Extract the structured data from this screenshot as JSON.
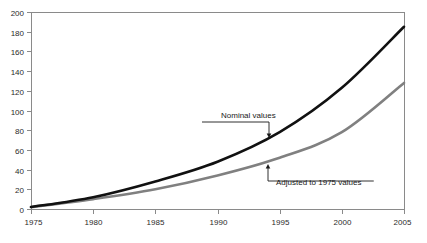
{
  "chart_data": {
    "type": "line",
    "title": "",
    "subtitle": "",
    "xlabel": "",
    "ylabel": "",
    "x": [
      1975,
      1980,
      1985,
      1990,
      1995,
      2000,
      2005
    ],
    "xlim": [
      1975,
      2005
    ],
    "ylim": [
      0,
      200
    ],
    "x_ticks": [
      "1975",
      "1980",
      "1985",
      "1990",
      "1995",
      "2000",
      "2005"
    ],
    "y_ticks": [
      "0",
      "20",
      "40",
      "60",
      "80",
      "100",
      "120",
      "140",
      "160",
      "180",
      "200"
    ],
    "grid": false,
    "legend_position": "none",
    "series": [
      {
        "name": "Nominal values",
        "color": "#111111",
        "width": 2.6,
        "values": [
          2,
          12,
          28,
          48,
          78,
          123,
          185
        ]
      },
      {
        "name": "Adjusted to 1975 values",
        "color": "#808080",
        "width": 2.6,
        "values": [
          2,
          10,
          20,
          34,
          52,
          78,
          128
        ]
      }
    ],
    "annotations": [
      {
        "text": "Nominal values",
        "text_x": 221,
        "text_y": 118,
        "target_x": 269,
        "target_y": 138,
        "elbow_y": 122,
        "arrow": "down"
      },
      {
        "text": "Adjusted to 1975 values",
        "text_x": 276,
        "text_y": 185,
        "target_x": 268,
        "target_y": 164,
        "elbow_y": 181,
        "arrow": "up"
      }
    ]
  },
  "axes": {
    "y_axis_name": "value-axis",
    "x_axis_name": "year-axis"
  }
}
